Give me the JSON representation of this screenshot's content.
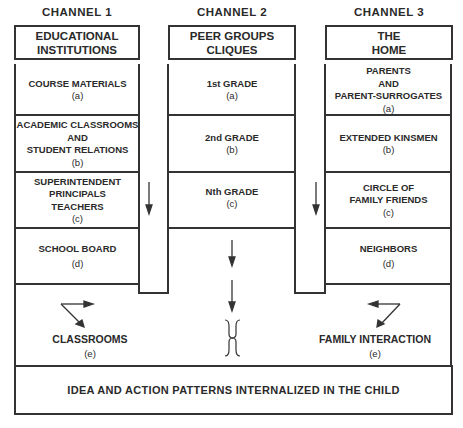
{
  "channels": [
    {
      "title": "CHANNEL 1",
      "header": [
        "EDUCATIONAL",
        "INSTITUTIONS"
      ],
      "cells": [
        {
          "lines": [
            "COURSE MATERIALS"
          ],
          "letter": "(a)"
        },
        {
          "lines": [
            "ACADEMIC CLASSROOMS",
            "AND",
            "STUDENT RELATIONS"
          ],
          "letter": "(b)"
        },
        {
          "lines": [
            "SUPERINTENDENT",
            "PRINCIPALS",
            "TEACHERS"
          ],
          "letter": "(c)"
        },
        {
          "lines": [
            "SCHOOL BOARD"
          ],
          "letter": "(d)"
        }
      ],
      "outcome": {
        "label": "CLASSROOMS",
        "letter": "(e)"
      }
    },
    {
      "title": "CHANNEL 2",
      "header": [
        "PEER GROUPS",
        "CLIQUES"
      ],
      "cells": [
        {
          "lines": [
            "1st GRADE"
          ],
          "letter": "(a)"
        },
        {
          "lines": [
            "2nd GRADE"
          ],
          "letter": "(b)"
        },
        {
          "lines": [
            "Nth GRADE"
          ],
          "letter": "(c)"
        }
      ]
    },
    {
      "title": "CHANNEL 3",
      "header": [
        "THE",
        "HOME"
      ],
      "cells": [
        {
          "lines": [
            "PARENTS",
            "AND",
            "PARENT-SURROGATES"
          ],
          "letter": "(a)"
        },
        {
          "lines": [
            "EXTENDED KINSMEN"
          ],
          "letter": "(b)"
        },
        {
          "lines": [
            "CIRCLE OF",
            "FAMILY FRIENDS"
          ],
          "letter": "(c)"
        },
        {
          "lines": [
            "NEIGHBORS"
          ],
          "letter": "(d)"
        }
      ],
      "outcome": {
        "label": "FAMILY INTERACTION",
        "letter": "(e)"
      }
    }
  ],
  "final": "IDEA AND ACTION PATTERNS INTERNALIZED IN THE CHILD",
  "icons": {
    "flow_arrow": "down-arrow",
    "brace": "double-brace",
    "diverge_left": "branch-arrows",
    "diverge_right": "branch-arrows"
  },
  "colors": {
    "line": "#333333",
    "text": "#2a2a2a",
    "background": "#ffffff"
  }
}
